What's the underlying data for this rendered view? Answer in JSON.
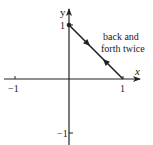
{
  "diagram": {
    "axes": {
      "x_label": "x",
      "y_label": "y",
      "x_ticks": [
        {
          "value": -1,
          "label": "−1"
        },
        {
          "value": 1,
          "label": "1"
        }
      ],
      "y_ticks": [
        {
          "value": 1,
          "label": "1"
        },
        {
          "value": -1,
          "label": "−1"
        }
      ]
    },
    "path": {
      "from": [
        0,
        1
      ],
      "to": [
        1,
        0
      ],
      "start_point_marker": "dot",
      "direction_arrows": [
        "toward (1,0)",
        "toward (0,1)"
      ]
    },
    "annotation": {
      "line1": "back and",
      "line2": "forth twice"
    },
    "colors": {
      "ink": "#222222",
      "background": "#ffffff"
    }
  }
}
